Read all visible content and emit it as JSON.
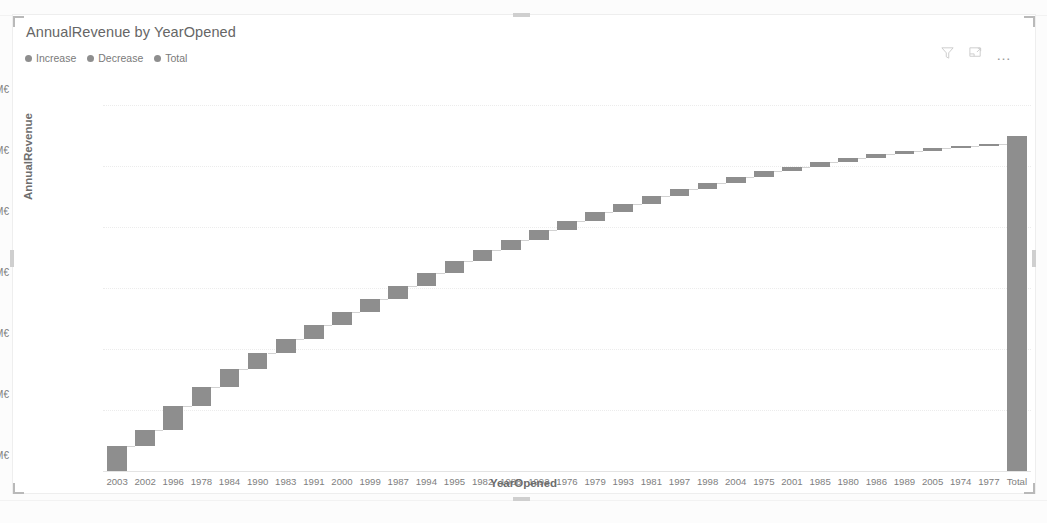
{
  "visual": {
    "title": "AnnualRevenue by YearOpened",
    "header_icons": [
      {
        "name": "filter-icon",
        "label": "Filters"
      },
      {
        "name": "focus-mode-icon",
        "label": "Focus mode"
      },
      {
        "name": "more-options-icon",
        "label": "More options"
      }
    ],
    "more_options_glyph": "…"
  },
  "legend": {
    "position": "top",
    "items": [
      {
        "label": "Increase",
        "color": "#8e8e8e"
      },
      {
        "label": "Decrease",
        "color": "#8e8e8e"
      },
      {
        "label": "Total",
        "color": "#8e8e8e"
      }
    ]
  },
  "chart_data": {
    "type": "bar",
    "subtype": "waterfall",
    "title": "AnnualRevenue by YearOpened",
    "xlabel": "YearOpened",
    "ylabel": "AnnualRevenue",
    "ylim": [
      0,
      120
    ],
    "yunit": "M€",
    "ytick_labels": [
      "0M€",
      "20M€",
      "40M€",
      "60M€",
      "80M€",
      "100M€",
      "120M€"
    ],
    "ytick_values": [
      0,
      20,
      40,
      60,
      80,
      100,
      120
    ],
    "grid": true,
    "categories": [
      "2003",
      "2002",
      "1996",
      "1978",
      "1984",
      "1990",
      "1983",
      "1991",
      "2000",
      "1999",
      "1987",
      "1994",
      "1995",
      "1982",
      "1988",
      "1992",
      "1976",
      "1979",
      "1993",
      "1981",
      "1997",
      "1998",
      "2004",
      "1975",
      "2001",
      "1985",
      "1980",
      "1986",
      "1989",
      "2005",
      "1974",
      "1977",
      "Total"
    ],
    "values": [
      8.2,
      5.2,
      7.8,
      6.2,
      6.1,
      5.2,
      4.6,
      4.5,
      4.4,
      4.3,
      4.2,
      4.1,
      3.9,
      3.6,
      3.4,
      3.3,
      3.1,
      2.8,
      2.7,
      2.5,
      2.3,
      2.1,
      1.9,
      1.8,
      1.6,
      1.5,
      1.3,
      1.2,
      1.1,
      1.0,
      0.8,
      0.6,
      110.0
    ],
    "cumulative": [
      8.2,
      13.4,
      21.2,
      27.4,
      33.5,
      38.7,
      43.3,
      47.8,
      52.2,
      56.5,
      60.7,
      64.8,
      68.7,
      72.3,
      75.7,
      79.0,
      82.1,
      84.9,
      87.6,
      90.1,
      92.4,
      94.5,
      96.4,
      98.2,
      99.8,
      101.3,
      102.6,
      103.8,
      104.9,
      105.9,
      106.7,
      107.3,
      110.0
    ],
    "total_category": "Total",
    "total_value": 110.0,
    "bar_color": "#8e8e8e",
    "connector_color": "#d2d2d2",
    "legend_entries": [
      "Increase",
      "Decrease",
      "Total"
    ]
  }
}
